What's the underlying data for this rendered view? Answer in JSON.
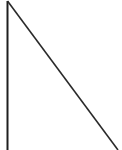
{
  "figure": {
    "name": "two-line-angle-figure",
    "width": 122,
    "height": 150,
    "background_color": "#ffffff",
    "stroke_color": "#222222",
    "strokes": [
      {
        "id": "vertical-line",
        "label": "vertical line",
        "x1": 7.5,
        "y1": 1,
        "x2": 7.5,
        "y2": 150,
        "width": 2,
        "color": "#1f1f1f"
      },
      {
        "id": "diagonal-line",
        "label": "diagonal line",
        "x1": 7.5,
        "y1": 1,
        "x2": 118,
        "y2": 150,
        "width": 1.6,
        "color": "#2a2a2a"
      }
    ],
    "vertices": [
      {
        "id": "apex",
        "label": "top vertex",
        "x": 7.5,
        "y": 1
      },
      {
        "id": "vertical-end",
        "label": "vertical line lower end",
        "x": 7.5,
        "y": 150
      },
      {
        "id": "diagonal-end",
        "label": "diagonal line lower end",
        "x": 118,
        "y": 150
      }
    ]
  }
}
